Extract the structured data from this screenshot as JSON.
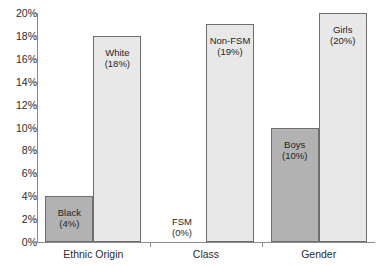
{
  "chart_data": {
    "type": "bar",
    "title": "",
    "subtitle": "",
    "xlabel": "",
    "ylabel": "",
    "ylim": [
      0,
      20
    ],
    "y_unit": "%",
    "grid": false,
    "legend_position": "none",
    "label_style": "in-bar two-line: name then (value%)",
    "y_ticks": [
      "0%",
      "2%",
      "4%",
      "6%",
      "8%",
      "10%",
      "12%",
      "14%",
      "16%",
      "18%",
      "20%"
    ],
    "y_tick_values": [
      0,
      2,
      4,
      6,
      8,
      10,
      12,
      14,
      16,
      18,
      20
    ],
    "categories": [
      "Ethnic Origin",
      "Class",
      "Gender"
    ],
    "colors": {
      "dark_bar": "#b2b2b2",
      "light_bar": "#e8e8e8",
      "bar_outline": "#6e6e6e",
      "axis": "#8a8a8a",
      "text": "#2b2b2b",
      "background": "#ffffff"
    },
    "groups": [
      {
        "category": "Ethnic Origin",
        "bars": [
          {
            "name": "Black",
            "value": 4,
            "value_label": "(4%)",
            "shade": "dark"
          },
          {
            "name": "White",
            "value": 18,
            "value_label": "(18%)",
            "shade": "light"
          }
        ]
      },
      {
        "category": "Class",
        "bars": [
          {
            "name": "FSM",
            "value": 0,
            "value_label": "(0%)",
            "shade": "dark"
          },
          {
            "name": "Non-FSM",
            "value": 19,
            "value_label": "(19%)",
            "shade": "light"
          }
        ]
      },
      {
        "category": "Gender",
        "bars": [
          {
            "name": "Boys",
            "value": 10,
            "value_label": "(10%)",
            "shade": "dark"
          },
          {
            "name": "Girls",
            "value": 20,
            "value_label": "(20%)",
            "shade": "light"
          }
        ]
      }
    ],
    "series": [
      {
        "name": "First subgroup",
        "values": [
          4,
          0,
          10
        ]
      },
      {
        "name": "Second subgroup",
        "values": [
          18,
          19,
          20
        ]
      }
    ]
  }
}
